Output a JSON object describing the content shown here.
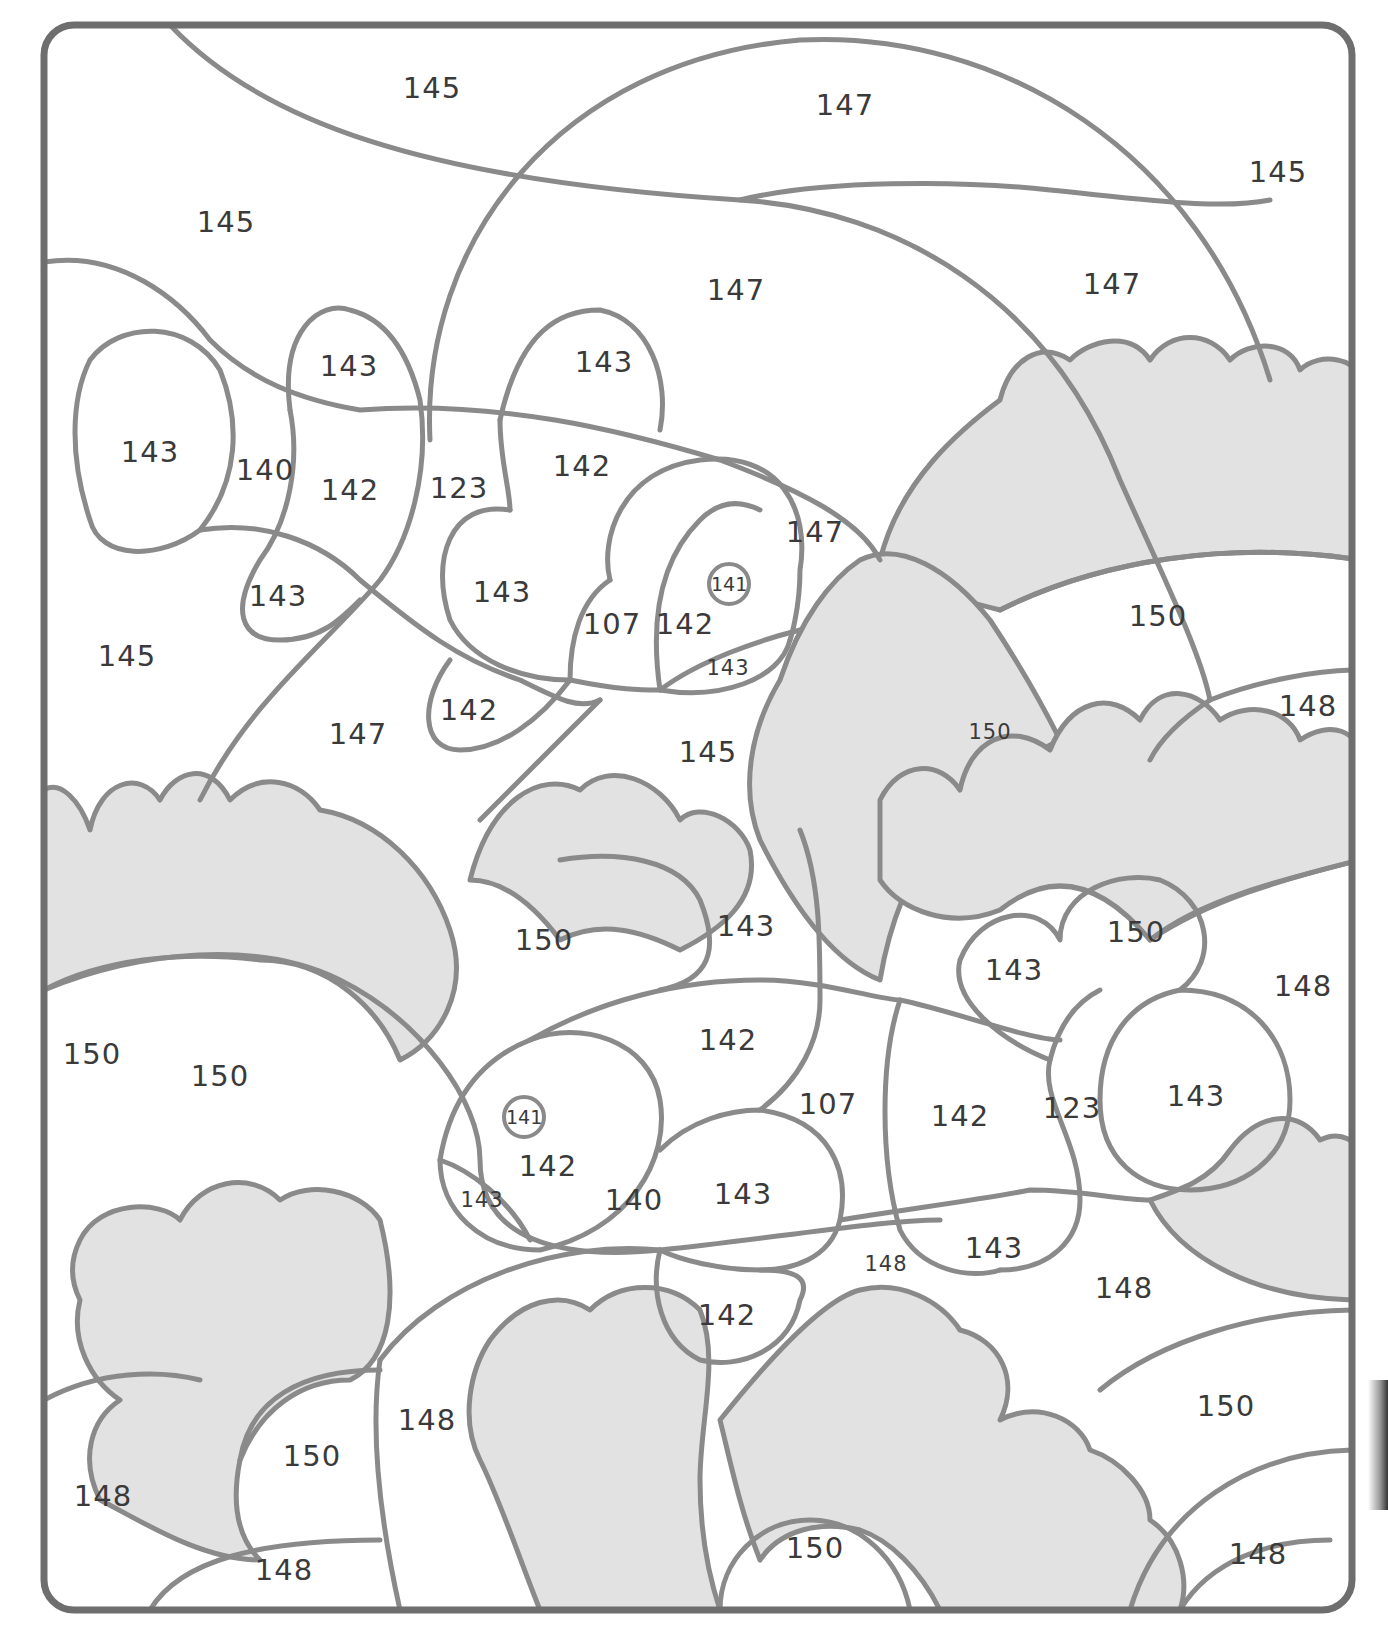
{
  "page": {
    "type": "color-by-number worksheet",
    "line_color": "#8a8a8a",
    "frame_color": "#6e6e6e",
    "anemone_fill": "#e2e2e2",
    "background": "#ffffff"
  },
  "regions": [
    {
      "id": "r1",
      "label": "145",
      "x": 432,
      "y": 88
    },
    {
      "id": "r2",
      "label": "147",
      "x": 845,
      "y": 105
    },
    {
      "id": "r3",
      "label": "145",
      "x": 1278,
      "y": 172
    },
    {
      "id": "r4",
      "label": "145",
      "x": 226,
      "y": 222
    },
    {
      "id": "r5",
      "label": "147",
      "x": 736,
      "y": 290
    },
    {
      "id": "r6",
      "label": "147",
      "x": 1112,
      "y": 284
    },
    {
      "id": "r7",
      "label": "143",
      "x": 349,
      "y": 366
    },
    {
      "id": "r8",
      "label": "143",
      "x": 604,
      "y": 362
    },
    {
      "id": "r9",
      "label": "143",
      "x": 150,
      "y": 452
    },
    {
      "id": "r10",
      "label": "140",
      "x": 265,
      "y": 470
    },
    {
      "id": "r11",
      "label": "142",
      "x": 350,
      "y": 490
    },
    {
      "id": "r12",
      "label": "123",
      "x": 459,
      "y": 488
    },
    {
      "id": "r13",
      "label": "142",
      "x": 582,
      "y": 466
    },
    {
      "id": "r14",
      "label": "147",
      "x": 815,
      "y": 532
    },
    {
      "id": "r15",
      "label": "143",
      "x": 278,
      "y": 596
    },
    {
      "id": "r16",
      "label": "143",
      "x": 502,
      "y": 592
    },
    {
      "id": "r17",
      "label": "107",
      "x": 612,
      "y": 624
    },
    {
      "id": "r18",
      "label": "142",
      "x": 685,
      "y": 624
    },
    {
      "id": "r19",
      "label": "141",
      "x": 729,
      "y": 584,
      "circled": true
    },
    {
      "id": "r20",
      "label": "143",
      "x": 728,
      "y": 668,
      "small": true
    },
    {
      "id": "r21",
      "label": "145",
      "x": 127,
      "y": 656
    },
    {
      "id": "r22",
      "label": "142",
      "x": 469,
      "y": 710
    },
    {
      "id": "r23",
      "label": "147",
      "x": 358,
      "y": 734
    },
    {
      "id": "r24",
      "label": "145",
      "x": 708,
      "y": 752
    },
    {
      "id": "r25",
      "label": "150",
      "x": 1158,
      "y": 616
    },
    {
      "id": "r26",
      "label": "150",
      "x": 990,
      "y": 732,
      "small": true
    },
    {
      "id": "r27",
      "label": "148",
      "x": 1308,
      "y": 706
    },
    {
      "id": "r28",
      "label": "143",
      "x": 746,
      "y": 926
    },
    {
      "id": "r29",
      "label": "150",
      "x": 544,
      "y": 940
    },
    {
      "id": "r30",
      "label": "150",
      "x": 1136,
      "y": 932
    },
    {
      "id": "r31",
      "label": "143",
      "x": 1014,
      "y": 970
    },
    {
      "id": "r32",
      "label": "148",
      "x": 1303,
      "y": 986
    },
    {
      "id": "r33",
      "label": "142",
      "x": 728,
      "y": 1040
    },
    {
      "id": "r34",
      "label": "150",
      "x": 92,
      "y": 1054
    },
    {
      "id": "r35",
      "label": "150",
      "x": 220,
      "y": 1076
    },
    {
      "id": "r36",
      "label": "107",
      "x": 828,
      "y": 1104
    },
    {
      "id": "r37",
      "label": "142",
      "x": 960,
      "y": 1116
    },
    {
      "id": "r38",
      "label": "123",
      "x": 1072,
      "y": 1108
    },
    {
      "id": "r39",
      "label": "143",
      "x": 1196,
      "y": 1096
    },
    {
      "id": "r40",
      "label": "141",
      "x": 524,
      "y": 1117,
      "circled": true
    },
    {
      "id": "r41",
      "label": "142",
      "x": 548,
      "y": 1166
    },
    {
      "id": "r42",
      "label": "143",
      "x": 482,
      "y": 1200,
      "small": true
    },
    {
      "id": "r43",
      "label": "140",
      "x": 634,
      "y": 1200
    },
    {
      "id": "r44",
      "label": "143",
      "x": 743,
      "y": 1194
    },
    {
      "id": "r45",
      "label": "148",
      "x": 886,
      "y": 1264,
      "small": true
    },
    {
      "id": "r46",
      "label": "143",
      "x": 994,
      "y": 1248
    },
    {
      "id": "r47",
      "label": "148",
      "x": 1124,
      "y": 1288
    },
    {
      "id": "r48",
      "label": "142",
      "x": 727,
      "y": 1315
    },
    {
      "id": "r49",
      "label": "148",
      "x": 427,
      "y": 1420
    },
    {
      "id": "r50",
      "label": "150",
      "x": 1226,
      "y": 1406
    },
    {
      "id": "r51",
      "label": "150",
      "x": 312,
      "y": 1456
    },
    {
      "id": "r52",
      "label": "148",
      "x": 103,
      "y": 1496
    },
    {
      "id": "r53",
      "label": "150",
      "x": 815,
      "y": 1548
    },
    {
      "id": "r54",
      "label": "148",
      "x": 284,
      "y": 1570
    },
    {
      "id": "r55",
      "label": "148",
      "x": 1258,
      "y": 1554
    }
  ]
}
